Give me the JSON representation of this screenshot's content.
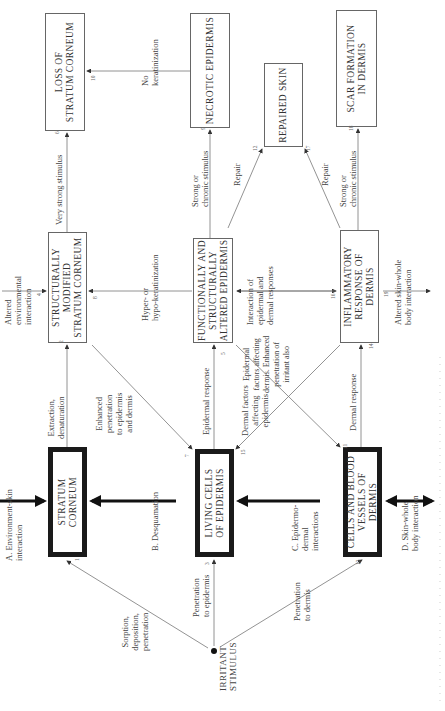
{
  "boxes": {
    "stratum_corneum": "STRATUM CORNEUM",
    "living_cells": "LIVING CELLS\nOF EPIDERMIS",
    "cells_blood": "CELLS AND BLOOD\nVESSELS OF\nDERMIS",
    "struct_modified": "STRUCTURALLY\nMODIFIED\nSTRATUM CORNEUM",
    "func_altered": "FUNCTIONALLY AND\nSTRUCTURALLY\nALTERED EPIDERMIS",
    "inflammatory": "INFLAMMATORY\nRESPONSE OF\nDERMIS",
    "loss_sc": "LOSS OF\nSTRATUM CORNEUM",
    "necrotic": "NECROTIC EPIDERMIS",
    "repaired": "REPAIRED SKIN",
    "scar": "SCAR FORMATION\nIN DERMIS"
  },
  "source": "IRRITANT\nSTIMULUS",
  "labels": {
    "sorption": "Sorption,\ndeposition,\npenetration",
    "pen_epidermis": "Penetration\nto epidermis",
    "pen_dermis": "Penetration\nto dermis",
    "env_skin": "A. Environment-skin\ninteraction",
    "desquamation": "B. Desquamation",
    "epi_dermal": "C. Epidermo-\ndermal\ninteractions",
    "skin_body": "D. Skin-whole\nbody interaction",
    "extraction": "Extraction,\ndenaturation",
    "enhanced": "Enhanced\npenetration\nto epidermis\nand dermis",
    "epidermal_response": "Epidermal response",
    "dermal_factors": "Dermal factors\naffecting\nepidermis",
    "epidermal_factors": "Epidermal\nfactors affecting\ndermis. Enhanced\npenetration of\nirritant also",
    "dermal_response": "Dermal response",
    "altered_env": "Altered\nenvironmental\ninteraction",
    "hyper_hypo": "Hyper- or\nhypo-keratinization",
    "interaction": "Interaction of\nepidermal and\ndermal responses",
    "altered_body": "Altered skin-whole\nbody interaction",
    "very_strong": "Very strong stimulus",
    "no_keratinization": "No\nkeratinization",
    "strong_chronic_1": "Strong or\nchronic stimulus",
    "strong_chronic_2": "Strong or\nchronic stimulus",
    "repair_1": "Repair",
    "repair_2": "Repair"
  },
  "numbers": {
    "n1": "1",
    "n2": "2",
    "n3": "3",
    "n4": "4",
    "n5": "5",
    "n6": "6",
    "n7": "7",
    "n8": "8",
    "n9": "9",
    "n10": "10",
    "n11": "11",
    "n12": "12",
    "n13": "13",
    "n14": "14",
    "n15": "15",
    "n16": "16",
    "n17": "17",
    "n18": "18",
    "n19": "19"
  }
}
